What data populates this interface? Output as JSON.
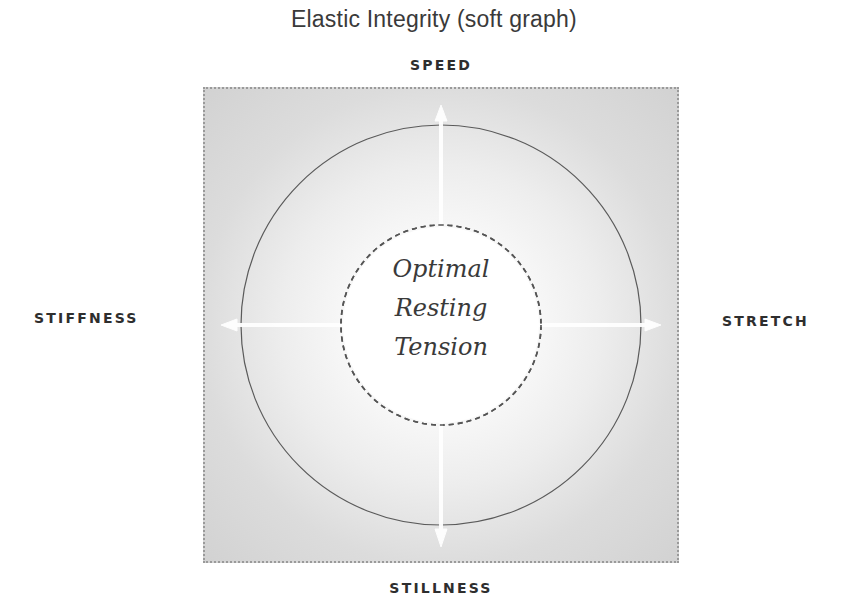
{
  "title": "Elastic Integrity (soft graph)",
  "axes": {
    "top": "SPEED",
    "bottom": "STILLNESS",
    "left": "STIFFNESS",
    "right": "STRETCH"
  },
  "center_label": {
    "lines": [
      "Optimal",
      "Resting",
      "Tension"
    ]
  },
  "diagram": {
    "outer_circle": "solid",
    "inner_circle": "dashed",
    "arrows": [
      "up",
      "down",
      "left",
      "right"
    ],
    "arrow_color": "#ffffff",
    "line_color": "#555555",
    "background_gradient": [
      "#ffffff",
      "#d2d2d2"
    ],
    "border_style": "dotted"
  }
}
